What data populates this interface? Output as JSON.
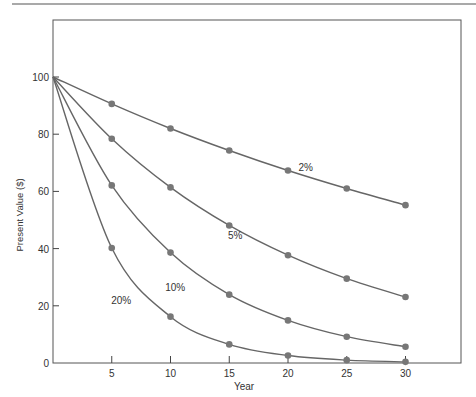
{
  "chart_data": {
    "type": "line",
    "title": "",
    "xlabel": "Year",
    "ylabel": "Present Value ($)",
    "x": [
      0,
      5,
      10,
      15,
      20,
      25,
      30
    ],
    "xticks": [
      5,
      10,
      15,
      20,
      25,
      30
    ],
    "yticks": [
      0,
      20,
      40,
      60,
      80,
      100
    ],
    "xlim": [
      0,
      34.7
    ],
    "ylim": [
      0,
      119
    ],
    "grid": false,
    "legend": "inline labels",
    "series": [
      {
        "name": "2%",
        "label_pos": [
          21.5,
          67
        ],
        "values": [
          100,
          90.6,
          82.0,
          74.3,
          67.3,
          61.0,
          55.2
        ]
      },
      {
        "name": "5%",
        "label_pos": [
          15.5,
          43.5
        ],
        "values": [
          100,
          78.4,
          61.4,
          48.1,
          37.7,
          29.5,
          23.1
        ]
      },
      {
        "name": "10%",
        "label_pos": [
          10.4,
          25.3
        ],
        "values": [
          100,
          62.1,
          38.6,
          23.9,
          14.9,
          9.2,
          5.7
        ]
      },
      {
        "name": "20%",
        "label_pos": [
          5.8,
          20.8
        ],
        "values": [
          100,
          40.2,
          16.2,
          6.5,
          2.6,
          1.0,
          0.4
        ]
      }
    ],
    "colors": {
      "line": "#666666",
      "marker": "#777777",
      "axis": "#444444",
      "text": "#333333"
    }
  }
}
